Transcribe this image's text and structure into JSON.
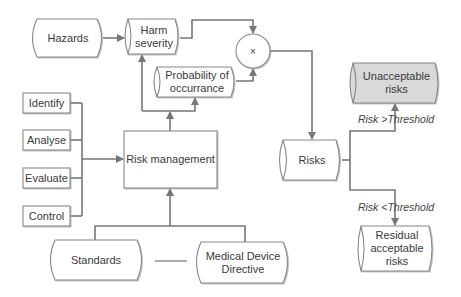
{
  "diagram": {
    "nodes": {
      "hazards": {
        "label": "Hazards",
        "shape": "stored-data"
      },
      "harm_severity": {
        "label": "Harm\nseverity",
        "line1": "Harm",
        "line2": "severity",
        "shape": "cylinder"
      },
      "multiply": {
        "label": "×",
        "shape": "circle"
      },
      "probability": {
        "line1": "Probability of",
        "line2": "occurrance",
        "shape": "cylinder"
      },
      "identify": {
        "label": "Identify",
        "shape": "rect"
      },
      "analyse": {
        "label": "Analyse",
        "shape": "rect"
      },
      "evaluate": {
        "label": "Evaluate",
        "shape": "rect"
      },
      "control": {
        "label": "Control",
        "shape": "rect"
      },
      "risk_management": {
        "label": "Risk management",
        "shape": "rect"
      },
      "standards": {
        "label": "Standards",
        "shape": "stored-data"
      },
      "mdd": {
        "line1": "Medical Device",
        "line2": "Directive",
        "shape": "stored-data"
      },
      "risks": {
        "label": "Risks",
        "shape": "cylinder"
      },
      "unacceptable": {
        "line1": "Unacceptable",
        "line2": "risks",
        "shape": "cylinder",
        "fill": "#d9d9d9"
      },
      "residual": {
        "line1": "Residual",
        "line2": "acceptable",
        "line3": "risks",
        "shape": "cylinder"
      }
    },
    "edge_labels": {
      "above_threshold": "Risk >Threshold",
      "below_threshold": "Risk <Threshold"
    },
    "edges": [
      {
        "from": "hazards",
        "to": "harm_severity"
      },
      {
        "from": "harm_severity",
        "to": "multiply"
      },
      {
        "from": "probability",
        "to": "multiply"
      },
      {
        "from": "multiply",
        "to": "risks"
      },
      {
        "from": "risk_management",
        "to": "harm_severity"
      },
      {
        "from": "risk_management",
        "to": "probability"
      },
      {
        "from": "identify",
        "to": "risk_management"
      },
      {
        "from": "analyse",
        "to": "risk_management"
      },
      {
        "from": "evaluate",
        "to": "risk_management"
      },
      {
        "from": "control",
        "to": "risk_management"
      },
      {
        "from": "standards",
        "to": "risk_management"
      },
      {
        "from": "mdd",
        "to": "risk_management"
      },
      {
        "from": "risks",
        "to": "unacceptable",
        "label": "Risk >Threshold"
      },
      {
        "from": "risks",
        "to": "residual",
        "label": "Risk <Threshold"
      }
    ],
    "colors": {
      "stroke": "#777777",
      "fill": "#ffffff",
      "highlight_fill": "#d9d9d9",
      "text": "#3a3a3a"
    }
  }
}
